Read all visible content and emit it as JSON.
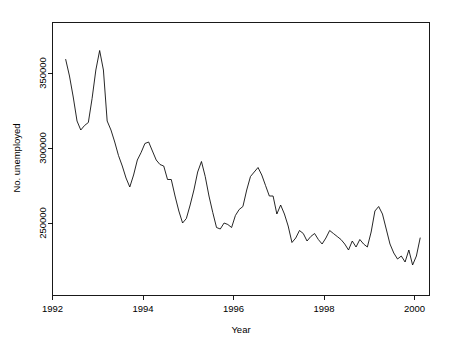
{
  "chart_data": {
    "type": "line",
    "title": "",
    "xlabel": "Year",
    "ylabel": "No. unemployed",
    "xlim": [
      1992.0,
      2000.4
    ],
    "ylim": [
      215000,
      365000
    ],
    "xticks": [
      1992,
      1994,
      1996,
      1998,
      2000
    ],
    "xtick_labels": [
      "1992",
      "1994",
      "1996",
      "1998",
      "2000"
    ],
    "yticks": [
      250000,
      300000,
      350000
    ],
    "ytick_labels": [
      "250000",
      "300000",
      "350000"
    ],
    "grid": false,
    "legend": null,
    "series": [
      {
        "name": "No. unemployed",
        "x": [
          1992.292,
          1992.375,
          1992.458,
          1992.542,
          1992.625,
          1992.708,
          1992.792,
          1992.875,
          1992.958,
          1993.042,
          1993.125,
          1993.208,
          1993.292,
          1993.375,
          1993.458,
          1993.542,
          1993.625,
          1993.708,
          1993.792,
          1993.875,
          1993.958,
          1994.042,
          1994.125,
          1994.208,
          1994.292,
          1994.375,
          1994.458,
          1994.542,
          1994.625,
          1994.708,
          1994.792,
          1994.875,
          1994.958,
          1995.042,
          1995.125,
          1995.208,
          1995.292,
          1995.375,
          1995.458,
          1995.542,
          1995.625,
          1995.708,
          1995.792,
          1995.875,
          1995.958,
          1996.042,
          1996.125,
          1996.208,
          1996.292,
          1996.375,
          1996.458,
          1996.542,
          1996.625,
          1996.708,
          1996.792,
          1996.875,
          1996.958,
          1997.042,
          1997.125,
          1997.208,
          1997.292,
          1997.375,
          1997.458,
          1997.542,
          1997.625,
          1997.708,
          1997.792,
          1997.875,
          1997.958,
          1998.042,
          1998.125,
          1998.208,
          1998.292,
          1998.375,
          1998.458,
          1998.542,
          1998.625,
          1998.708,
          1998.792,
          1998.875,
          1998.958,
          1999.042,
          1999.125,
          1999.208,
          1999.292,
          1999.375,
          1999.458,
          1999.542,
          1999.625,
          1999.708,
          1999.792,
          1999.875,
          1999.958,
          2000.042,
          2000.125
        ],
        "values": [
          359000,
          348000,
          334000,
          318000,
          312000,
          315000,
          317000,
          333000,
          352000,
          365000,
          352000,
          318000,
          312000,
          304000,
          295000,
          288000,
          280000,
          274000,
          282000,
          292000,
          297000,
          303000,
          304000,
          298000,
          292000,
          289000,
          288000,
          279000,
          279000,
          268000,
          258000,
          250000,
          253000,
          262000,
          272000,
          284000,
          291000,
          281000,
          268000,
          257000,
          247000,
          246000,
          250000,
          249000,
          247000,
          255000,
          259000,
          261000,
          272000,
          281000,
          284000,
          287000,
          282000,
          275000,
          268000,
          268000,
          256000,
          262000,
          256000,
          248000,
          237000,
          240000,
          245000,
          243000,
          238000,
          241000,
          243000,
          239000,
          236000,
          240000,
          245000,
          243000,
          241000,
          239000,
          236000,
          232000,
          238000,
          234000,
          239000,
          236000,
          234000,
          244000,
          258000,
          261000,
          256000,
          246000,
          236000,
          230000,
          226000,
          228000,
          224000,
          232000,
          222000,
          228000,
          240000
        ]
      }
    ]
  },
  "axis": {
    "y_label": "No. unemployed",
    "x_label": "Year",
    "x_tick_0": "1992",
    "x_tick_1": "1994",
    "x_tick_2": "1996",
    "x_tick_3": "1998",
    "x_tick_4": "2000",
    "y_tick_0": "250000",
    "y_tick_1": "300000",
    "y_tick_2": "350000"
  },
  "style": {
    "line_color": "#000000",
    "axis_color": "#000000",
    "background": "#ffffff"
  }
}
